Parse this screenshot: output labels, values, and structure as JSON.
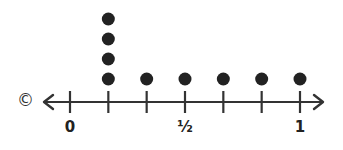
{
  "chart_data": {
    "type": "dot_plot",
    "title": "",
    "xlabel": "",
    "ylabel": "",
    "xlim": [
      0,
      1
    ],
    "ticks": [
      "0",
      "1/6",
      "2/6",
      "3/6",
      "4/6",
      "5/6",
      "1"
    ],
    "tick_labels": [
      {
        "position": 0,
        "label": "0"
      },
      {
        "position": 0.5,
        "label": "½"
      },
      {
        "position": 1,
        "label": "1"
      }
    ],
    "categories": [
      "1/6",
      "2/6",
      "3/6",
      "4/6",
      "5/6",
      "1"
    ],
    "values": [
      4,
      1,
      1,
      1,
      1,
      1
    ],
    "grid": false,
    "legend": null,
    "dot_color": "#222222",
    "axis_color": "#333333"
  },
  "copyright_symbol": "©",
  "labels": {
    "zero": "0",
    "half": "½",
    "one": "1"
  }
}
